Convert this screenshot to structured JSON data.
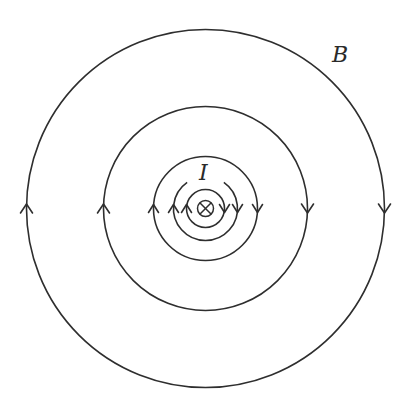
{
  "figure": {
    "labels": {
      "field": "B",
      "current": "I"
    },
    "current_symbol": "into-page-cross",
    "stroke_color": "#2e2e2e",
    "center": [
      205.5,
      208.5
    ],
    "field_lines": [
      {
        "radius": 179,
        "direction": "clockwise",
        "arrows": [
          "left-up",
          "right-down"
        ],
        "gap": null
      },
      {
        "radius": 102,
        "direction": "clockwise",
        "arrows": [
          "left-up",
          "right-down"
        ],
        "gap": null
      },
      {
        "radius": 52,
        "direction": "clockwise",
        "arrows": [
          "left-up",
          "right-down"
        ],
        "gap": null
      },
      {
        "radius": 32,
        "direction": "clockwise",
        "arrows": [
          "left-up",
          "right-down"
        ],
        "gap": "top"
      },
      {
        "radius": 19,
        "direction": "clockwise",
        "arrows": [
          "left-up",
          "right-down"
        ],
        "gap": null
      }
    ],
    "wire_radius": 8
  }
}
